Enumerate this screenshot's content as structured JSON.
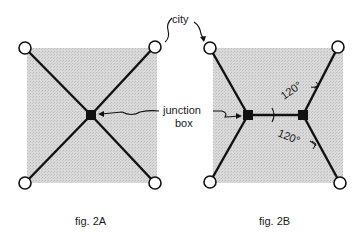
{
  "labels": {
    "city": "city",
    "junction_line1": "junction",
    "junction_line2": "box",
    "angle_top": "120°",
    "angle_bottom": "120°",
    "caption_a": "fig. 2A",
    "caption_b": "fig. 2B"
  },
  "colors": {
    "region_fill": "#d6d6d6",
    "line": "#111111",
    "city_fill": "#ffffff"
  },
  "figures": [
    {
      "id": "2A",
      "description": "Four cities at corners of a square joined through a single central junction box (X-shaped network)"
    },
    {
      "id": "2B",
      "description": "Four cities joined through two junction boxes (Steiner tree) with 120° angles at each junction"
    }
  ]
}
